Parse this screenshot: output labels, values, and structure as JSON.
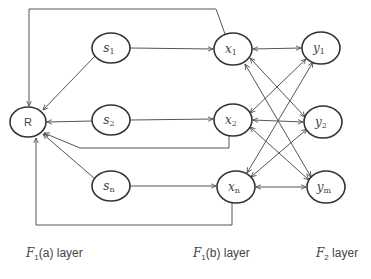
{
  "diagram": {
    "type": "network",
    "colors": {
      "stroke": "#444444",
      "text": "#444444",
      "background": "#ffffff"
    },
    "nodes": [
      {
        "id": "R",
        "label": "R"
      },
      {
        "id": "s1",
        "label": "s",
        "sub": "1"
      },
      {
        "id": "s2",
        "label": "s",
        "sub": "2"
      },
      {
        "id": "sn",
        "label": "s",
        "sub": "n"
      },
      {
        "id": "x1",
        "label": "x",
        "sub": "1"
      },
      {
        "id": "x2",
        "label": "x",
        "sub": "2"
      },
      {
        "id": "xn",
        "label": "x",
        "sub": "n"
      },
      {
        "id": "y1",
        "label": "y",
        "sub": "1"
      },
      {
        "id": "y2",
        "label": "y",
        "sub": "2"
      },
      {
        "id": "ym",
        "label": "y",
        "sub": "m"
      }
    ],
    "edges": [
      {
        "from": "s1",
        "to": "x1",
        "directed": true
      },
      {
        "from": "s2",
        "to": "x2",
        "directed": true
      },
      {
        "from": "sn",
        "to": "xn",
        "directed": true
      },
      {
        "from": "s1",
        "to": "R",
        "directed": true
      },
      {
        "from": "s2",
        "to": "R",
        "directed": true
      },
      {
        "from": "sn",
        "to": "R",
        "directed": true
      },
      {
        "from": "x1",
        "to": "R",
        "directed": true,
        "routing": "top loop"
      },
      {
        "from": "x2",
        "to": "R",
        "directed": true,
        "routing": "below loop"
      },
      {
        "from": "xn",
        "to": "R",
        "directed": true,
        "routing": "bottom loop"
      },
      {
        "from": "x1",
        "to": "y1",
        "bidirectional": true
      },
      {
        "from": "x1",
        "to": "y2",
        "bidirectional": true
      },
      {
        "from": "x1",
        "to": "ym",
        "bidirectional": true
      },
      {
        "from": "x2",
        "to": "y1",
        "bidirectional": true
      },
      {
        "from": "x2",
        "to": "y2",
        "bidirectional": true
      },
      {
        "from": "x2",
        "to": "ym",
        "bidirectional": true
      },
      {
        "from": "xn",
        "to": "y1",
        "bidirectional": true
      },
      {
        "from": "xn",
        "to": "y2",
        "bidirectional": true
      },
      {
        "from": "xn",
        "to": "ym",
        "bidirectional": true
      }
    ],
    "layers": [
      {
        "symbol": "F",
        "sub": "1",
        "text": "(a) layer"
      },
      {
        "symbol": "F",
        "sub": "1",
        "text": "(b) layer"
      },
      {
        "symbol": "F",
        "sub": "2",
        "text": " layer"
      }
    ]
  }
}
